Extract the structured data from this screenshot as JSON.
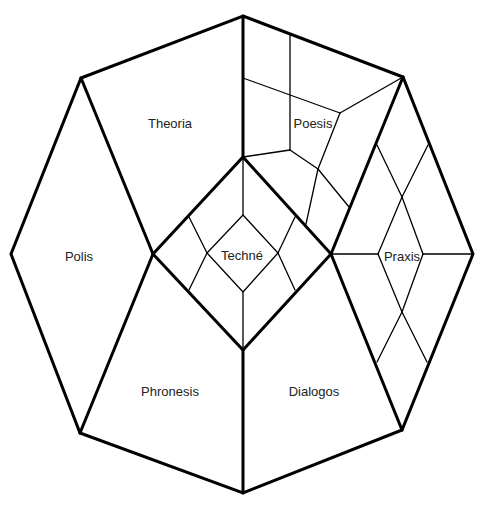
{
  "diagram": {
    "stroke_color": "#000000",
    "background": "#ffffff",
    "regions": [
      {
        "id": "theoria",
        "label": "Theoria",
        "x": 170,
        "y": 123
      },
      {
        "id": "poesis",
        "label": "Poesis",
        "x": 313,
        "y": 123
      },
      {
        "id": "polis",
        "label": "Polis",
        "x": 79,
        "y": 256
      },
      {
        "id": "techne",
        "label": "Techné",
        "x": 242,
        "y": 255
      },
      {
        "id": "praxis",
        "label": "Praxis",
        "x": 402,
        "y": 256
      },
      {
        "id": "phronesis",
        "label": "Phronesis",
        "x": 170,
        "y": 391
      },
      {
        "id": "dialogos",
        "label": "Dialogos",
        "x": 314,
        "y": 391
      }
    ]
  }
}
